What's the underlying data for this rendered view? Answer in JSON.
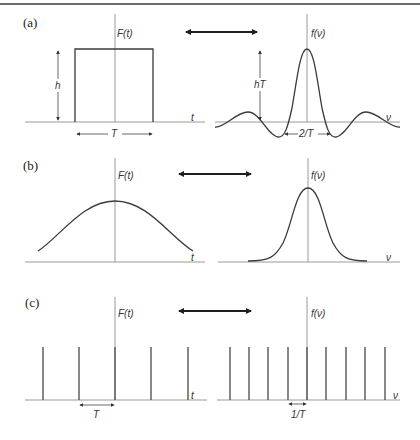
{
  "figure": {
    "top_rule_color": "#6a6a6a",
    "panels": [
      {
        "id": "a",
        "label": "(a)",
        "time_domain": {
          "axis_label": "F(t)",
          "x_label": "t",
          "shape": "rectangular pulse",
          "height_label": "h",
          "width_label": "T"
        },
        "freq_domain": {
          "axis_label": "f(ν)",
          "x_label": "ν",
          "shape": "sinc",
          "height_label": "hT",
          "width_label": "2/T"
        }
      },
      {
        "id": "b",
        "label": "(b)",
        "time_domain": {
          "axis_label": "F(t)",
          "x_label": "t",
          "shape": "broad gaussian"
        },
        "freq_domain": {
          "axis_label": "f(ν)",
          "x_label": "ν",
          "shape": "narrow gaussian"
        }
      },
      {
        "id": "c",
        "label": "(c)",
        "time_domain": {
          "axis_label": "F(t)",
          "x_label": "t",
          "shape": "comb",
          "spacing_label": "T",
          "spike_count": 5
        },
        "freq_domain": {
          "axis_label": "f(ν)",
          "x_label": "ν",
          "shape": "comb",
          "spacing_label": "1/T",
          "spike_count": 9
        }
      }
    ]
  }
}
